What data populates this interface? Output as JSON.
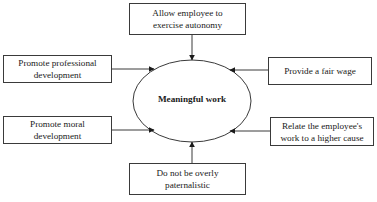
{
  "diagram": {
    "center": {
      "label": "Meaningful work"
    },
    "nodes": [
      {
        "id": "top",
        "label": "Allow employee to exercise autonomy",
        "lines": [
          "Allow employee to",
          "exercise autonomy"
        ]
      },
      {
        "id": "left-top",
        "label": "Promote professional development",
        "lines": [
          "Promote professional",
          "development"
        ]
      },
      {
        "id": "right-top",
        "label": "Provide a fair wage",
        "lines": [
          "Provide a fair wage"
        ]
      },
      {
        "id": "left-bottom",
        "label": "Promote moral development",
        "lines": [
          "Promote moral",
          "development"
        ]
      },
      {
        "id": "right-bottom",
        "label": "Relate the employee's work to a higher cause",
        "lines": [
          "Relate the employee's",
          "work to a higher cause"
        ]
      },
      {
        "id": "bottom",
        "label": "Do not be overly paternalistic",
        "lines": [
          "Do not be overly",
          "paternalistic"
        ]
      }
    ],
    "edges": [
      {
        "from": "top",
        "to": "center"
      },
      {
        "from": "left-top",
        "to": "center"
      },
      {
        "from": "right-top",
        "to": "center"
      },
      {
        "from": "left-bottom",
        "to": "center"
      },
      {
        "from": "right-bottom",
        "to": "center"
      },
      {
        "from": "bottom",
        "to": "center"
      }
    ]
  }
}
